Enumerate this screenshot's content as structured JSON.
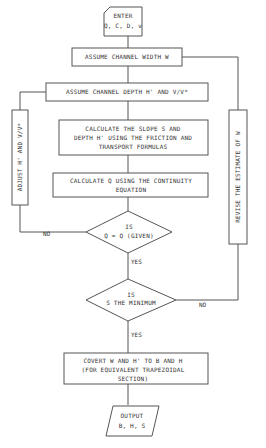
{
  "flowchart": {
    "start": {
      "line1": "ENTER",
      "line2": "Q, C, D, ν"
    },
    "assume_width": {
      "label": "ASSUME CHANNEL WIDTH W"
    },
    "assume_depth": {
      "label": "ASSUME CHANNEL DEPTH H' AND V/V*"
    },
    "calc_slope": {
      "line1": "CALCULATE THE SLOPE S AND",
      "line2": "DEPTH H' USING THE FRICTION AND",
      "line3": "TRANSPORT FORMULAS"
    },
    "calc_q": {
      "line1": "CALCULATE Q USING THE CONTINUITY",
      "line2": "EQUATION"
    },
    "decision_q": {
      "line1": "IS",
      "line2": "Q = Q (GIVEN)",
      "yes": "YES",
      "no": "NO"
    },
    "adjust": {
      "label": "ADJUST H' AND V/V*"
    },
    "decision_s": {
      "line1": "IS",
      "line2": "S THE MINIMUM",
      "yes": "YES",
      "no": "NO"
    },
    "revise": {
      "label": "REVISE THE ESTIMATE OF W"
    },
    "convert": {
      "line1": "COVERT W AND H' TO B AND H",
      "line2": "(FOR EQUIVALENT TRAPEZOIDAL",
      "line3": "SECTION)"
    },
    "output": {
      "line1": "OUTPUT",
      "line2": "B, H, S"
    }
  }
}
